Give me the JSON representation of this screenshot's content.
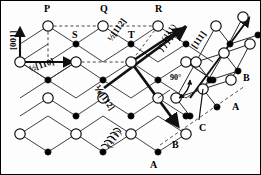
{
  "figure": {
    "background": "#ffffff",
    "line_color": "#1a1a1a",
    "border_color": "#000000",
    "atom_open_fill": "#ffffff",
    "atom_filled_fill": "#000000"
  },
  "point_labels": [
    {
      "id": "P",
      "text": "P",
      "x": 44,
      "y": 4
    },
    {
      "id": "Q",
      "text": "Q",
      "x": 100,
      "y": 4
    },
    {
      "id": "R",
      "text": "R",
      "x": 155,
      "y": 4
    },
    {
      "id": "S",
      "text": "S",
      "x": 72,
      "y": 30
    },
    {
      "id": "T",
      "text": "T",
      "x": 128,
      "y": 30
    },
    {
      "id": "A1",
      "text": "A",
      "x": 232,
      "y": 102
    },
    {
      "id": "B1",
      "text": "B",
      "x": 243,
      "y": 73
    },
    {
      "id": "C1",
      "text": "C",
      "x": 199,
      "y": 123
    },
    {
      "id": "B2",
      "text": "B",
      "x": 172,
      "y": 140
    },
    {
      "id": "A2",
      "text": "A",
      "x": 150,
      "y": 160
    }
  ],
  "vector_labels": [
    {
      "id": "dir-001",
      "text": "[001]",
      "x": 9,
      "y": 50,
      "rot": -90
    },
    {
      "id": "half-110",
      "text": "½[110]",
      "x": 28,
      "y": 65,
      "rot": -18
    },
    {
      "id": "half-112",
      "text": "½[112]",
      "x": 106,
      "y": 38,
      "rot": -55
    },
    {
      "id": "sixth-112",
      "text": "⅙[112]",
      "x": 100,
      "y": 84,
      "rot": 55
    },
    {
      "id": "dir-111",
      "text": "[111]",
      "x": 190,
      "y": 45,
      "rot": -55
    }
  ],
  "plane_labels": [
    {
      "id": "plane-111-top",
      "text": "(111)",
      "x": 160,
      "y": 38,
      "rot": -55
    },
    {
      "id": "plane-111-bottom",
      "text": "(111)",
      "x": 105,
      "y": 144,
      "rot": -55
    }
  ],
  "angle_labels": [
    {
      "id": "angle-90",
      "text": "90°",
      "x": 170,
      "y": 74
    }
  ],
  "geometry": {
    "open_atom_radius": 5.2,
    "filled_atom_radius": 3.1,
    "open_atoms_left": [
      [
        48,
        26
      ],
      [
        103,
        26
      ],
      [
        158,
        26
      ],
      [
        20,
        62
      ],
      [
        76,
        62
      ],
      [
        131,
        62
      ],
      [
        186,
        62
      ],
      [
        48,
        98
      ],
      [
        103,
        98
      ],
      [
        158,
        98
      ],
      [
        20,
        134
      ],
      [
        76,
        134
      ],
      [
        131,
        134
      ],
      [
        186,
        134
      ]
    ],
    "filled_atoms_left": [
      [
        76,
        44
      ],
      [
        131,
        44
      ],
      [
        186,
        44
      ],
      [
        48,
        80
      ],
      [
        103,
        80
      ],
      [
        158,
        80
      ],
      [
        213,
        80
      ],
      [
        76,
        116
      ],
      [
        131,
        116
      ],
      [
        186,
        116
      ],
      [
        48,
        152
      ],
      [
        103,
        152
      ],
      [
        158,
        152
      ]
    ],
    "open_atoms_right": [
      [
        216,
        26
      ],
      [
        243,
        17
      ],
      [
        196,
        62
      ],
      [
        224,
        53
      ],
      [
        250,
        44
      ],
      [
        176,
        98
      ],
      [
        203,
        89
      ],
      [
        231,
        80
      ]
    ],
    "filled_atoms_right": [
      [
        230,
        44
      ],
      [
        258,
        35
      ],
      [
        210,
        80
      ],
      [
        238,
        71
      ],
      [
        190,
        116
      ],
      [
        217,
        107
      ]
    ]
  }
}
